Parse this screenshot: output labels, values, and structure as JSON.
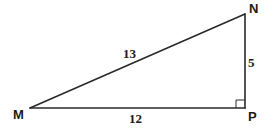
{
  "diagram": {
    "type": "right-triangle",
    "vertices": {
      "M": {
        "label": "M",
        "x": 30,
        "y": 108
      },
      "N": {
        "label": "N",
        "x": 245,
        "y": 14
      },
      "P": {
        "label": "P",
        "x": 245,
        "y": 108
      }
    },
    "sides": {
      "MN": {
        "label": "13"
      },
      "NP": {
        "label": "5"
      },
      "MP": {
        "label": "12"
      }
    },
    "right_angle_at": "P",
    "colors": {
      "stroke": "#2a2a2a",
      "text": "#1a1a1a",
      "background": "#ffffff"
    }
  }
}
